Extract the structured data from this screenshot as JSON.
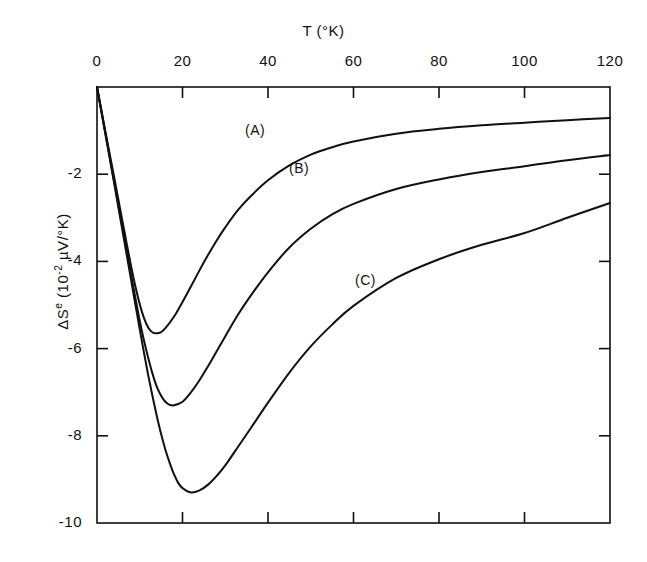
{
  "chart_data": {
    "type": "line",
    "title": "",
    "xlabel": "T (°K)",
    "ylabel": "ΔS^e (10^-2 µV/°K)",
    "ylabel_parts": {
      "delta_s": "ΔS",
      "superscript_e": "e",
      "unit_open": " (10",
      "unit_exponent": "-2",
      "unit_close": " µV/°K)"
    },
    "xlim": [
      0,
      120
    ],
    "ylim": [
      -10,
      0
    ],
    "xticks": [
      0,
      20,
      40,
      60,
      80,
      100,
      120
    ],
    "xtick_labels": [
      "0",
      "20",
      "40",
      "60",
      "80",
      "100",
      "120"
    ],
    "yticks": [
      -2,
      -4,
      -6,
      -8,
      -10
    ],
    "ytick_labels": [
      "-2",
      "-4",
      "-6",
      "-8",
      "-10"
    ],
    "grid": false,
    "legend_position": "inline-annotations",
    "x_axis_position": "top",
    "y_axis_position": "left",
    "line_color": "#101010",
    "line_width": 2.0,
    "frame_color": "#101010",
    "series": [
      {
        "name": "(A)",
        "label": "(A)",
        "minimum": {
          "x": 14,
          "y": -5.65
        },
        "asymptote": -0.71,
        "x": [
          0,
          1,
          2,
          3,
          4,
          5,
          6,
          7,
          8,
          9,
          10,
          11,
          12,
          13,
          14,
          15,
          16,
          18,
          20,
          22,
          24,
          26,
          28,
          30,
          33,
          36,
          40,
          45,
          50,
          55,
          60,
          70,
          80,
          90,
          100,
          110,
          120
        ],
        "values": [
          0,
          -0.52,
          -1.04,
          -1.55,
          -2.06,
          -2.58,
          -3.1,
          -3.62,
          -4.12,
          -4.58,
          -4.98,
          -5.3,
          -5.52,
          -5.63,
          -5.65,
          -5.62,
          -5.53,
          -5.27,
          -4.93,
          -4.57,
          -4.2,
          -3.85,
          -3.52,
          -3.22,
          -2.82,
          -2.5,
          -2.14,
          -1.8,
          -1.55,
          -1.38,
          -1.25,
          -1.07,
          -0.96,
          -0.88,
          -0.82,
          -0.76,
          -0.71
        ]
      },
      {
        "name": "(B)",
        "label": "(B)",
        "minimum": {
          "x": 16.5,
          "y": -7.3
        },
        "asymptote": -1.56,
        "x": [
          0,
          1,
          2,
          3,
          4,
          5,
          6,
          7,
          8,
          9,
          10,
          11,
          12,
          13,
          14,
          15,
          16,
          17,
          18,
          20,
          22,
          24,
          26,
          28,
          30,
          33,
          36,
          40,
          45,
          50,
          55,
          60,
          70,
          80,
          90,
          100,
          110,
          120
        ],
        "values": [
          0,
          -0.54,
          -1.08,
          -1.62,
          -2.16,
          -2.7,
          -3.24,
          -3.78,
          -4.32,
          -4.85,
          -5.36,
          -5.82,
          -6.22,
          -6.58,
          -6.88,
          -7.08,
          -7.22,
          -7.29,
          -7.3,
          -7.22,
          -7.0,
          -6.72,
          -6.4,
          -6.06,
          -5.72,
          -5.22,
          -4.78,
          -4.25,
          -3.68,
          -3.25,
          -2.92,
          -2.68,
          -2.34,
          -2.12,
          -1.95,
          -1.82,
          -1.68,
          -1.56
        ]
      },
      {
        "name": "(C)",
        "label": "(C)",
        "minimum": {
          "x": 19,
          "y": -9.3
        },
        "asymptote": -2.66,
        "x": [
          0,
          1,
          2,
          3,
          4,
          5,
          6,
          7,
          8,
          9,
          10,
          11,
          12,
          13,
          14,
          15,
          16,
          17,
          18,
          19,
          20,
          22,
          24,
          26,
          28,
          30,
          33,
          36,
          40,
          45,
          50,
          55,
          60,
          70,
          80,
          90,
          100,
          110,
          120
        ],
        "values": [
          0,
          -0.55,
          -1.1,
          -1.65,
          -2.2,
          -2.76,
          -3.32,
          -3.88,
          -4.44,
          -5.0,
          -5.56,
          -6.1,
          -6.62,
          -7.1,
          -7.55,
          -7.96,
          -8.32,
          -8.62,
          -8.88,
          -9.08,
          -9.2,
          -9.3,
          -9.25,
          -9.12,
          -8.92,
          -8.68,
          -8.25,
          -7.82,
          -7.24,
          -6.55,
          -5.95,
          -5.45,
          -5.02,
          -4.38,
          -3.95,
          -3.62,
          -3.35,
          -3.0,
          -2.66
        ]
      }
    ],
    "annotations": [
      {
        "text": "(A)",
        "x_px": 245,
        "y_px": 122
      },
      {
        "text": "(B)",
        "x_px": 289,
        "y_px": 160
      },
      {
        "text": "(C)",
        "x_px": 355,
        "y_px": 272
      }
    ]
  }
}
